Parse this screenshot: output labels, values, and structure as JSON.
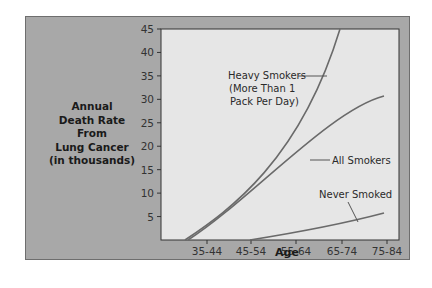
{
  "chart_data": {
    "type": "line",
    "title": "",
    "ylabel": "Annual Death Rate From Lung Cancer (in thousands)",
    "ylabel_lines": [
      "Annual",
      "Death Rate",
      "From",
      "Lung Cancer",
      "(in thousands)"
    ],
    "xlabel": "Age",
    "categories": [
      "35-44",
      "45-54",
      "55-64",
      "65-74",
      "75-84"
    ],
    "yticks": [
      5,
      10,
      15,
      20,
      25,
      30,
      35,
      40,
      45
    ],
    "ylim": [
      0,
      45
    ],
    "grid": false,
    "series": [
      {
        "name": "Heavy Smokers (More Than 1 Pack Per Day)",
        "label_lines": [
          "Heavy Smokers",
          "(More Than 1",
          "Pack Per Day)"
        ],
        "values": [
          2,
          12,
          24,
          45,
          null
        ]
      },
      {
        "name": "All Smokers",
        "label_lines": [
          "All Smokers"
        ],
        "values": [
          1.5,
          8,
          16,
          22,
          24.5
        ]
      },
      {
        "name": "Never Smoked",
        "label_lines": [
          "Never Smoked"
        ],
        "values": [
          0,
          0,
          1.5,
          3.5,
          5.5
        ]
      }
    ]
  }
}
